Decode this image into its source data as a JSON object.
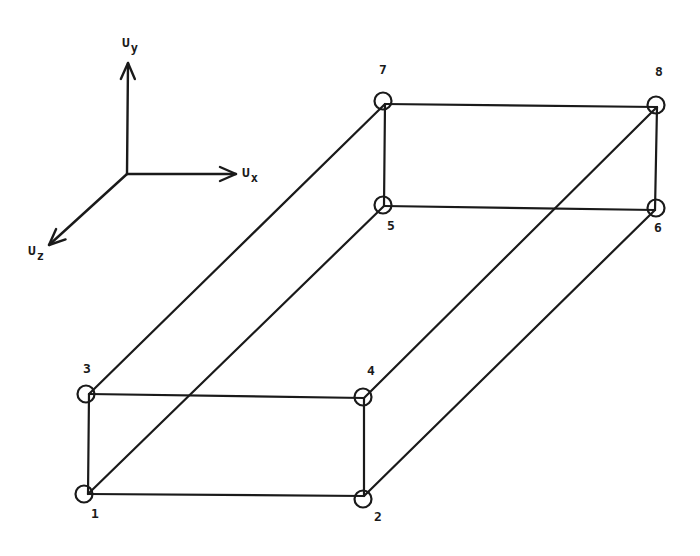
{
  "diagram": {
    "colors": {
      "line": "#1a1a1a",
      "background": "#ffffff"
    },
    "axes": {
      "origin": [
        127,
        174
      ],
      "items": [
        {
          "id": "uy",
          "symbol": "U",
          "subscript": "y",
          "tip": [
            128,
            63
          ],
          "label_pos": [
            122,
            36
          ]
        },
        {
          "id": "ux",
          "symbol": "U",
          "subscript": "x",
          "tip": [
            236,
            174
          ],
          "label_pos": [
            242,
            166
          ]
        },
        {
          "id": "uz",
          "symbol": "U",
          "subscript": "z",
          "tip": [
            49,
            245
          ],
          "label_pos": [
            28,
            244
          ]
        }
      ]
    },
    "nodes": [
      {
        "id": "1",
        "label": "1",
        "vertex": [
          88,
          494
        ],
        "circle": [
          84,
          494
        ],
        "label_pos": [
          95,
          513
        ]
      },
      {
        "id": "2",
        "label": "2",
        "vertex": [
          364,
          496
        ],
        "circle": [
          363,
          499
        ],
        "label_pos": [
          378,
          516
        ]
      },
      {
        "id": "3",
        "label": "3",
        "vertex": [
          89,
          394
        ],
        "circle": [
          86,
          394
        ],
        "label_pos": [
          87,
          368
        ]
      },
      {
        "id": "4",
        "label": "4",
        "vertex": [
          364,
          398
        ],
        "circle": [
          363,
          397
        ],
        "label_pos": [
          371,
          370
        ]
      },
      {
        "id": "5",
        "label": "5",
        "vertex": [
          384,
          206
        ],
        "circle": [
          383,
          205
        ],
        "label_pos": [
          391,
          225
        ]
      },
      {
        "id": "6",
        "label": "6",
        "vertex": [
          655,
          210
        ],
        "circle": [
          656,
          208
        ],
        "label_pos": [
          658,
          227
        ]
      },
      {
        "id": "7",
        "label": "7",
        "vertex": [
          385,
          104
        ],
        "circle": [
          383,
          101
        ],
        "label_pos": [
          383,
          69
        ]
      },
      {
        "id": "8",
        "label": "8",
        "vertex": [
          657,
          107
        ],
        "circle": [
          656,
          105
        ],
        "label_pos": [
          659,
          71
        ]
      }
    ],
    "node_radius": 8.5,
    "edges": [
      [
        "1",
        "2"
      ],
      [
        "3",
        "4"
      ],
      [
        "1",
        "3"
      ],
      [
        "2",
        "4"
      ],
      [
        "5",
        "6"
      ],
      [
        "7",
        "8"
      ],
      [
        "5",
        "7"
      ],
      [
        "6",
        "8"
      ],
      [
        "1",
        "5"
      ],
      [
        "2",
        "6"
      ],
      [
        "3",
        "7"
      ],
      [
        "4",
        "8"
      ]
    ]
  }
}
